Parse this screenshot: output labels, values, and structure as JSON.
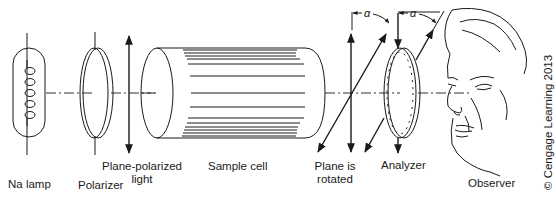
{
  "diagram": {
    "components": [
      {
        "id": "na-lamp",
        "label": "Na lamp"
      },
      {
        "id": "polarizer",
        "label": "Polarizer"
      },
      {
        "id": "plane-polarized-light",
        "label_line1": "Plane-polarized",
        "label_line2": "light"
      },
      {
        "id": "sample-cell",
        "label": "Sample cell"
      },
      {
        "id": "plane-rotated",
        "label_line1": "Plane is",
        "label_line2": "rotated"
      },
      {
        "id": "analyzer",
        "label": "Analyzer"
      },
      {
        "id": "observer",
        "label": "Observer"
      }
    ],
    "angle_symbol": "α",
    "copyright": "© Cengage Learning 2013",
    "line_color": "#1a1a1a",
    "background": "#ffffff"
  }
}
